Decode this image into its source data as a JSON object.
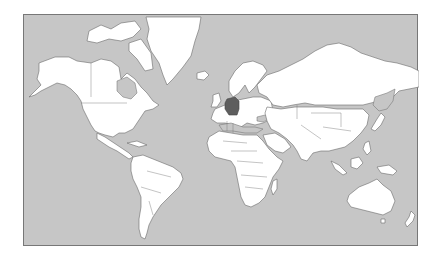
{
  "map": {
    "projection": "Mercator",
    "ocean_color": "#c6c6c6",
    "land_color": "#ffffff",
    "border_color": "#6a6a6a",
    "highlight_color": "#5e5e5e",
    "highlighted_region": "Germany",
    "continents": [
      "North America",
      "Greenland",
      "South America",
      "Europe",
      "Africa",
      "Asia",
      "Australia",
      "New Zealand",
      "Antarctic islands"
    ]
  }
}
